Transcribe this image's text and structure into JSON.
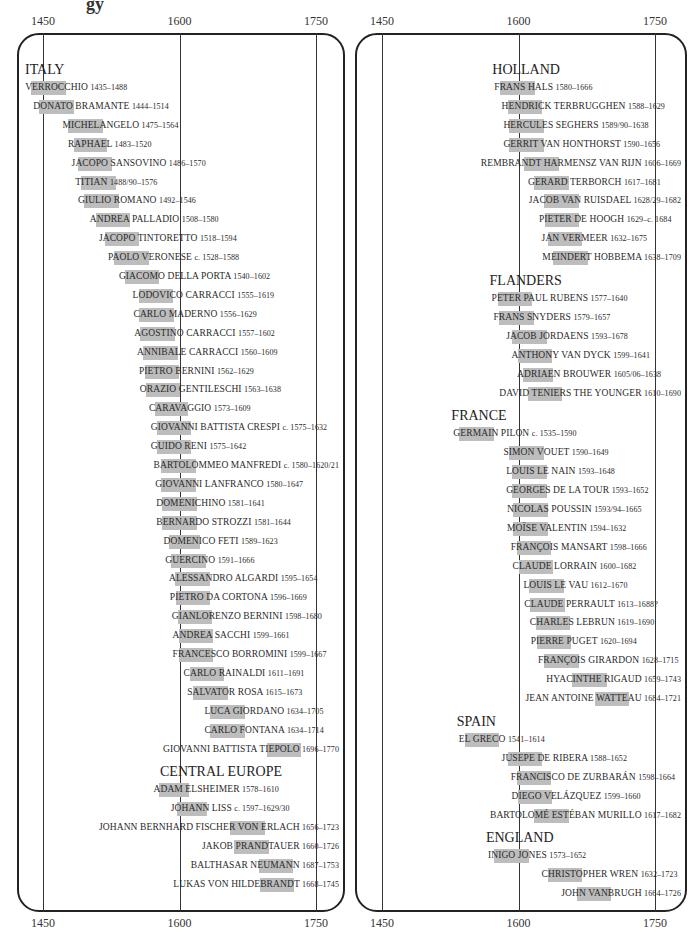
{
  "chart_data": {
    "type": "timeline",
    "title": "",
    "xlabel": "",
    "ylabel": "",
    "axis_ticks": [
      "1450",
      "1600",
      "1750"
    ],
    "xlim": [
      1420,
      1780
    ],
    "grid": true,
    "panels": [
      {
        "regions": [
          {
            "name": "ITALY",
            "artists": [
              {
                "name": "VERROCCHIO",
                "dates": "1435–1488",
                "bar": [
                  1437,
                  1486
                ]
              },
              {
                "name": "DONATO BRAMANTE",
                "dates": "1444–1514",
                "bar": [
                  1446,
                  1514
                ]
              },
              {
                "name": "MICHELANGELO",
                "dates": "1475–1564",
                "bar": [
                  1478,
                  1564
                ]
              },
              {
                "name": "RAPHAEL",
                "dates": "1483–1520",
                "bar": [
                  1484,
                  1520
                ]
              },
              {
                "name": "JACOPO SANSOVINO",
                "dates": "1486–1570",
                "bar": [
                  1488,
                  1570
                ]
              },
              {
                "name": "TITIAN",
                "dates": "1488/90–1576",
                "bar": [
                  1492,
                  1576
                ]
              },
              {
                "name": "GIULIO ROMANO",
                "dates": "1492–1546",
                "bar": [
                  1495,
                  1546
                ]
              },
              {
                "name": "ANDREA PALLADIO",
                "dates": "1508–1580",
                "bar": [
                  1508,
                  1580
                ]
              },
              {
                "name": "JACOPO TINTORETTO",
                "dates": "1518–1594",
                "bar": [
                  1518,
                  1594
                ]
              },
              {
                "name": "PAOLO VERONESE",
                "dates": "c. 1528–1588",
                "bar": [
                  1528,
                  1588
                ]
              },
              {
                "name": "GIACOMO DELLA PORTA",
                "dates": "1540–1602",
                "bar": [
                  1540,
                  1602
                ]
              },
              {
                "name": "LODOVICO CARRACCI",
                "dates": "1555–1619",
                "bar": [
                  1555,
                  1619
                ]
              },
              {
                "name": "CARLO MADERNO",
                "dates": "1556–1629",
                "bar": [
                  1556,
                  1599
                ]
              },
              {
                "name": "AGOSTINO CARRACCI",
                "dates": "1557–1602",
                "bar": [
                  1557,
                  1602
                ]
              },
              {
                "name": "ANNIBALE CARRACCI",
                "dates": "1560–1609",
                "bar": [
                  1560,
                  1600
                ]
              },
              {
                "name": "PIETRO BERNINI",
                "dates": "1562–1629",
                "bar": [
                  1562,
                  1629
                ]
              },
              {
                "name": "ORAZIO GENTILESCHI",
                "dates": "1563–1638",
                "bar": [
                  1563,
                  1638
                ]
              },
              {
                "name": "CARAVAGGIO",
                "dates": "1573–1609",
                "bar": [
                  1573,
                  1609
                ]
              },
              {
                "name": "GIOVANNI BATTISTA CRESPI",
                "dates": "c. 1575–1632",
                "bar": [
                  1575,
                  1632
                ]
              },
              {
                "name": "GUIDO RENI",
                "dates": "1575–1642",
                "bar": [
                  1575,
                  1642
                ]
              },
              {
                "name": "BARTOLOMMEO MANFREDI",
                "dates": "c. 1580–1620/21",
                "bar": [
                  1580,
                  1620
                ]
              },
              {
                "name": "GIOVANNI LANFRANCO",
                "dates": "1580–1647",
                "bar": [
                  1580,
                  1647
                ]
              },
              {
                "name": "DOMENICHINO",
                "dates": "1581–1641",
                "bar": [
                  1581,
                  1641
                ]
              },
              {
                "name": "BERNARDO STROZZI",
                "dates": "1581–1644",
                "bar": [
                  1581,
                  1644
                ]
              },
              {
                "name": "DOMENICO FETI",
                "dates": "1589–1623",
                "bar": [
                  1589,
                  1623
                ]
              },
              {
                "name": "GUERCINO",
                "dates": "1591–1666",
                "bar": [
                  1591,
                  1666
                ]
              },
              {
                "name": "ALESSANDRO ALGARDI",
                "dates": "1595–1654",
                "bar": [
                  1595,
                  1654
                ]
              },
              {
                "name": "PIETRO DA CORTONA",
                "dates": "1596–1669",
                "bar": [
                  1596,
                  1669
                ]
              },
              {
                "name": "GIANLORENZO BERNINI",
                "dates": "1598–1680",
                "bar": [
                  1598,
                  1680
                ]
              },
              {
                "name": "ANDREA SACCHI",
                "dates": "1599–1661",
                "bar": [
                  1599,
                  1661
                ]
              },
              {
                "name": "FRANCESCO BORROMINI",
                "dates": "1599–1667",
                "bar": [
                  1599,
                  1667
                ]
              },
              {
                "name": "CARLO RAINALDI",
                "dates": "1611–1691",
                "bar": [
                  1611,
                  1691
                ]
              },
              {
                "name": "SALVATOR ROSA",
                "dates": "1615–1673",
                "bar": [
                  1615,
                  1673
                ]
              },
              {
                "name": "LUCA GIORDANO",
                "dates": "1634–1705",
                "bar": [
                  1634,
                  1705
                ]
              },
              {
                "name": "CARLO FONTANA",
                "dates": "1634–1714",
                "bar": [
                  1634,
                  1714
                ]
              },
              {
                "name": "GIOVANNI BATTISTA TIEPOLO",
                "dates": "1696–1770",
                "bar": [
                  1696,
                  1770
                ]
              }
            ]
          },
          {
            "name": "CENTRAL EUROPE",
            "artists": [
              {
                "name": "ADAM ELSHEIMER",
                "dates": "1578–1610",
                "bar": [
                  1578,
                  1610
                ]
              },
              {
                "name": "JOHANN LISS",
                "dates": "c. 1597–1629/30",
                "bar": [
                  1597,
                  1630
                ]
              },
              {
                "name": "JOHANN BERNHARD FISCHER VON ERLACH",
                "dates": "1656–1723",
                "bar": [
                  1656,
                  1723
                ]
              },
              {
                "name": "JAKOB PRANDTAUER",
                "dates": "1660–1726",
                "bar": [
                  1660,
                  1726
                ]
              },
              {
                "name": "BALTHASAR NEUMANN",
                "dates": "1687–1753",
                "bar": [
                  1687,
                  1753
                ]
              },
              {
                "name": "LUKAS VON HILDEBRANDT",
                "dates": "1668–1745",
                "bar": [
                  1688,
                  1745
                ]
              }
            ]
          }
        ]
      },
      {
        "regions": [
          {
            "name": "HOLLAND",
            "artists": [
              {
                "name": "FRANS HALS",
                "dates": "1580–1666",
                "bar": [
                  1580,
                  1666
                ]
              },
              {
                "name": "HENDRICK TERBRUGGHEN",
                "dates": "1588–1629",
                "bar": [
                  1588,
                  1629
                ]
              },
              {
                "name": "HERCULES SEGHERS",
                "dates": "1589/90–1638",
                "bar": [
                  1590,
                  1638
                ]
              },
              {
                "name": "GERRIT VAN HONTHORST",
                "dates": "1590–1656",
                "bar": [
                  1590,
                  1656
                ]
              },
              {
                "name": "REMBRANDT HARMENSZ VAN RIJN",
                "dates": "1606–1669",
                "bar": [
                  1606,
                  1669
                ]
              },
              {
                "name": "GERARD TERBORCH",
                "dates": "1617–1681",
                "bar": [
                  1617,
                  1681
                ]
              },
              {
                "name": "JACOB VAN RUISDAEL",
                "dates": "1628/29–1682",
                "bar": [
                  1628,
                  1682
                ]
              },
              {
                "name": "PIETER DE HOOGH",
                "dates": "1629–c. 1684",
                "bar": [
                  1629,
                  1684
                ]
              },
              {
                "name": "JAN VERMEER",
                "dates": "1632–1675",
                "bar": [
                  1632,
                  1675
                ]
              },
              {
                "name": "MEINDERT HOBBEMA",
                "dates": "1638–1709",
                "bar": [
                  1638,
                  1709
                ]
              }
            ]
          },
          {
            "name": "FLANDERS",
            "artists": [
              {
                "name": "PETER PAUL RUBENS",
                "dates": "1577–1640",
                "bar": [
                  1577,
                  1640
                ]
              },
              {
                "name": "FRANS SNYDERS",
                "dates": "1579–1657",
                "bar": [
                  1579,
                  1657
                ]
              },
              {
                "name": "JACOB JORDAENS",
                "dates": "1593–1678",
                "bar": [
                  1593,
                  1678
                ]
              },
              {
                "name": "ANTHONY VAN DYCK",
                "dates": "1599–1641",
                "bar": [
                  1599,
                  1641
                ]
              },
              {
                "name": "ADRIAEN BROUWER",
                "dates": "1605/06–1638",
                "bar": [
                  1605,
                  1638
                ]
              },
              {
                "name": "DAVID TENIERS THE YOUNGER",
                "dates": "1610–1690",
                "bar": [
                  1610,
                  1690
                ]
              }
            ]
          },
          {
            "name": "FRANCE",
            "artists": [
              {
                "name": "GERMAIN PILON",
                "dates": "c. 1535–1590",
                "bar": [
                  1535,
                  1590
                ]
              },
              {
                "name": "SIMON VOUET",
                "dates": "1590–1649",
                "bar": [
                  1590,
                  1649
                ]
              },
              {
                "name": "LOUIS LE NAIN",
                "dates": "1593–1648",
                "bar": [
                  1593,
                  1648
                ]
              },
              {
                "name": "GEORGES DE LA TOUR",
                "dates": "1593–1652",
                "bar": [
                  1593,
                  1652
                ]
              },
              {
                "name": "NICOLAS POUSSIN",
                "dates": "1593/94–1665",
                "bar": [
                  1594,
                  1665
                ]
              },
              {
                "name": "MOÏSE VALENTIN",
                "dates": "1594–1632",
                "bar": [
                  1594,
                  1632
                ]
              },
              {
                "name": "FRANÇOIS MANSART",
                "dates": "1598–1666",
                "bar": [
                  1598,
                  1666
                ]
              },
              {
                "name": "CLAUDE LORRAIN",
                "dates": "1600–1682",
                "bar": [
                  1600,
                  1682
                ]
              },
              {
                "name": "LOUIS LE VAU",
                "dates": "1612–1670",
                "bar": [
                  1612,
                  1670
                ]
              },
              {
                "name": "CLAUDE PERRAULT",
                "dates": "1613–1688?",
                "bar": [
                  1613,
                  1688
                ]
              },
              {
                "name": "CHARLES LEBRUN",
                "dates": "1619–1690",
                "bar": [
                  1619,
                  1690
                ]
              },
              {
                "name": "PIERRE PUGET",
                "dates": "1620–1694",
                "bar": [
                  1620,
                  1694
                ]
              },
              {
                "name": "FRANÇOIS GIRARDON",
                "dates": "1628–1715",
                "bar": [
                  1628,
                  1715
                ]
              },
              {
                "name": "HYACINTHE RIGAUD",
                "dates": "1659–1743",
                "bar": [
                  1659,
                  1743
                ]
              },
              {
                "name": "JEAN ANTOINE WATTEAU",
                "dates": "1684–1721",
                "bar": [
                  1684,
                  1721
                ]
              }
            ]
          },
          {
            "name": "SPAIN",
            "artists": [
              {
                "name": "EL GRECO",
                "dates": "1541–1614",
                "bar": [
                  1541,
                  1614
                ]
              },
              {
                "name": "JUSEPE DE RIBERA",
                "dates": "1588–1652",
                "bar": [
                  1588,
                  1652
                ]
              },
              {
                "name": "FRANCISCO DE ZURBARÁN",
                "dates": "1598–1664",
                "bar": [
                  1598,
                  1664
                ]
              },
              {
                "name": "DIEGO VELÁZQUEZ",
                "dates": "1599–1660",
                "bar": [
                  1599,
                  1660
                ]
              },
              {
                "name": "BARTOLOMÉ ESTÉBAN MURILLO",
                "dates": "1617–1682",
                "bar": [
                  1617,
                  1682
                ]
              }
            ]
          },
          {
            "name": "ENGLAND",
            "artists": [
              {
                "name": "INIGO JONES",
                "dates": "1573–1652",
                "bar": [
                  1573,
                  1652
                ]
              },
              {
                "name": "CHRISTOPHER WREN",
                "dates": "1632–1723",
                "bar": [
                  1632,
                  1723
                ]
              },
              {
                "name": "JOHN VANBRUGH",
                "dates": "1664–1726",
                "bar": [
                  1664,
                  1726
                ]
              }
            ]
          }
        ]
      }
    ]
  },
  "fragment_text": "gy",
  "axis": {
    "t1450": "1450",
    "t1600": "1600",
    "t1750": "1750"
  }
}
